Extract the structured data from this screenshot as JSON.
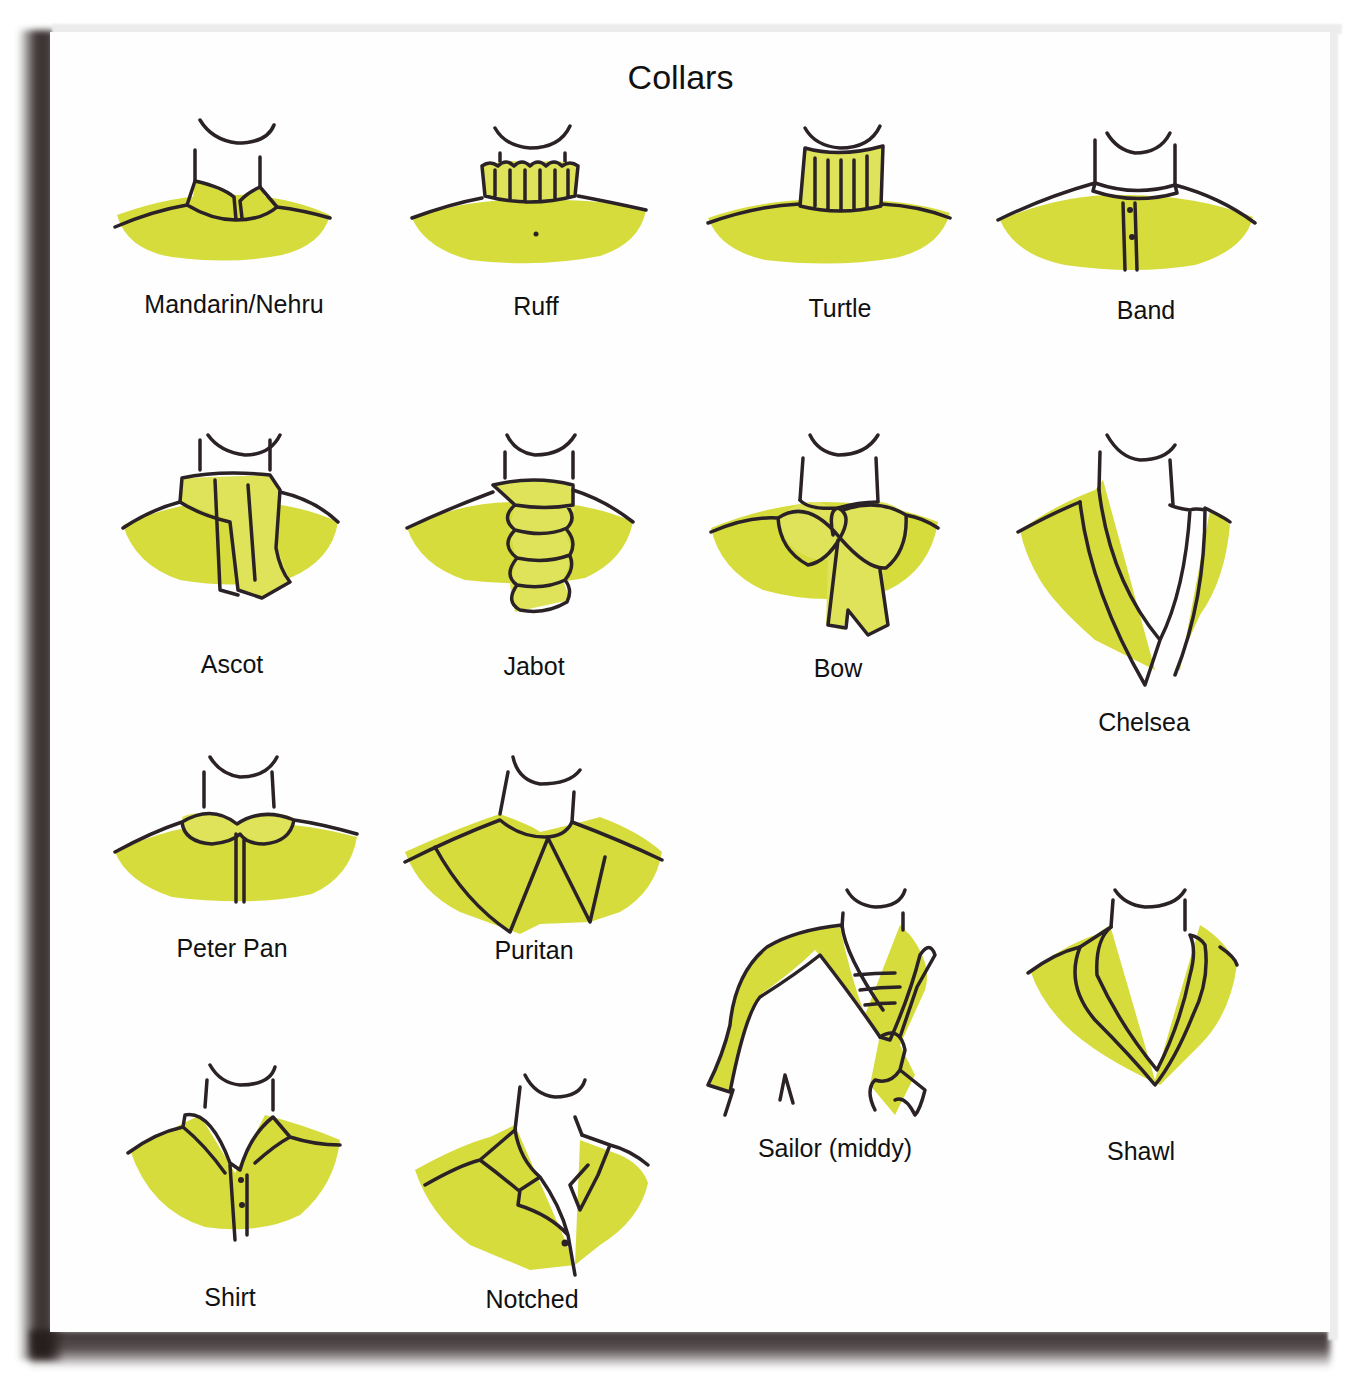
{
  "title": "Collars",
  "accent_color": "#d6dc3c",
  "collars": [
    {
      "id": "mandarin",
      "label": "Mandarin/Nehru"
    },
    {
      "id": "ruff",
      "label": "Ruff"
    },
    {
      "id": "turtle",
      "label": "Turtle"
    },
    {
      "id": "band",
      "label": "Band"
    },
    {
      "id": "ascot",
      "label": "Ascot"
    },
    {
      "id": "jabot",
      "label": "Jabot"
    },
    {
      "id": "bow",
      "label": "Bow"
    },
    {
      "id": "chelsea",
      "label": "Chelsea"
    },
    {
      "id": "peter-pan",
      "label": "Peter Pan"
    },
    {
      "id": "puritan",
      "label": "Puritan"
    },
    {
      "id": "sailor",
      "label": "Sailor (middy)"
    },
    {
      "id": "shawl",
      "label": "Shawl"
    },
    {
      "id": "shirt",
      "label": "Shirt"
    },
    {
      "id": "notched",
      "label": "Notched"
    }
  ]
}
